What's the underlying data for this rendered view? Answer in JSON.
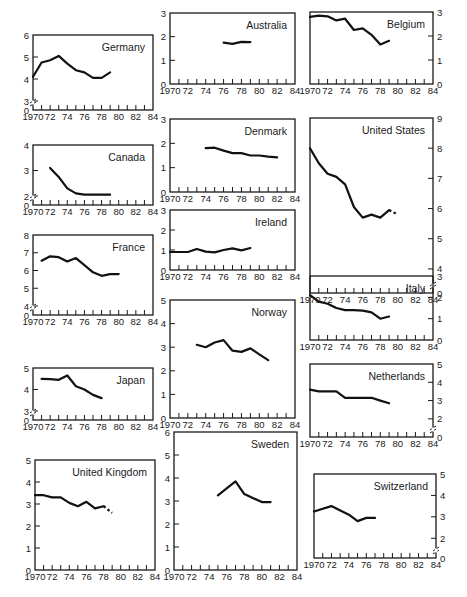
{
  "figure": {
    "x_ticks": [
      "1970",
      "72",
      "74",
      "76",
      "78",
      "80",
      "82",
      "84"
    ]
  },
  "chart_data": [
    {
      "type": "line",
      "title": "Germany",
      "axis_side": "left",
      "y_ticks": [
        0,
        3,
        4,
        5,
        6
      ],
      "axis_break": true,
      "ylim": [
        3,
        6
      ],
      "xlim": [
        1970,
        1984
      ],
      "x": [
        1970,
        1971,
        1972,
        1973,
        1974,
        1975,
        1976,
        1977,
        1978,
        1979
      ],
      "values": [
        4.1,
        4.75,
        4.85,
        5.05,
        4.7,
        4.4,
        4.3,
        4.05,
        4.05,
        4.3
      ]
    },
    {
      "type": "line",
      "title": "Australia",
      "axis_side": "left",
      "y_ticks": [
        0,
        1,
        2,
        3
      ],
      "axis_break": false,
      "ylim": [
        0,
        3
      ],
      "xlim": [
        1970,
        1984
      ],
      "x": [
        1976,
        1977,
        1978,
        1979
      ],
      "values": [
        1.75,
        1.7,
        1.78,
        1.77
      ]
    },
    {
      "type": "line",
      "title": "Belgium",
      "axis_side": "right",
      "y_ticks": [
        0,
        1,
        2,
        3
      ],
      "axis_break": false,
      "ylim": [
        0,
        3
      ],
      "xlim": [
        1970,
        1984
      ],
      "x": [
        1970,
        1971,
        1972,
        1973,
        1974,
        1975,
        1976,
        1977,
        1978,
        1979
      ],
      "values": [
        2.8,
        2.85,
        2.82,
        2.65,
        2.72,
        2.25,
        2.32,
        2.05,
        1.65,
        1.8
      ]
    },
    {
      "type": "line",
      "title": "Canada",
      "axis_side": "left",
      "y_ticks": [
        0,
        2,
        3,
        4
      ],
      "axis_break": true,
      "ylim": [
        2,
        4
      ],
      "xlim": [
        1970,
        1984
      ],
      "x": [
        1972,
        1973,
        1974,
        1975,
        1976,
        1977,
        1978,
        1979
      ],
      "values": [
        3.1,
        2.75,
        2.3,
        2.1,
        2.05,
        2.05,
        2.05,
        2.05
      ]
    },
    {
      "type": "line",
      "title": "Denmark",
      "axis_side": "left",
      "y_ticks": [
        0,
        1,
        2,
        3
      ],
      "axis_break": false,
      "ylim": [
        0,
        3
      ],
      "xlim": [
        1970,
        1984
      ],
      "x": [
        1974,
        1975,
        1976,
        1977,
        1978,
        1979,
        1980,
        1981,
        1982
      ],
      "values": [
        1.8,
        1.82,
        1.7,
        1.6,
        1.6,
        1.5,
        1.5,
        1.45,
        1.42
      ]
    },
    {
      "type": "line",
      "title": "United States",
      "axis_side": "right",
      "y_ticks": [
        0,
        4,
        5,
        6,
        7,
        8,
        9
      ],
      "axis_break": true,
      "ylim": [
        3.5,
        9
      ],
      "xlim": [
        1970,
        1984
      ],
      "x": [
        1970,
        1971,
        1972,
        1973,
        1974,
        1975,
        1976,
        1977,
        1978,
        1979
      ],
      "values": [
        8.0,
        7.5,
        7.15,
        7.05,
        6.8,
        6.05,
        5.7,
        5.8,
        5.7,
        5.95
      ],
      "projected": {
        "x": [
          1979,
          1980
        ],
        "values": [
          5.95,
          5.8
        ]
      }
    },
    {
      "type": "line",
      "title": "France",
      "axis_side": "left",
      "y_ticks": [
        0,
        4,
        5,
        6,
        7,
        8
      ],
      "axis_break": true,
      "ylim": [
        4,
        8
      ],
      "xlim": [
        1970,
        1984
      ],
      "x": [
        1971,
        1972,
        1973,
        1974,
        1975,
        1976,
        1977,
        1978,
        1979,
        1980
      ],
      "values": [
        6.55,
        6.8,
        6.75,
        6.5,
        6.7,
        6.3,
        5.9,
        5.7,
        5.8,
        5.8
      ]
    },
    {
      "type": "line",
      "title": "Ireland",
      "axis_side": "left",
      "y_ticks": [
        0,
        1,
        2,
        3
      ],
      "axis_break": false,
      "ylim": [
        0,
        3
      ],
      "xlim": [
        1970,
        1984
      ],
      "x": [
        1970,
        1971,
        1972,
        1973,
        1974,
        1975,
        1976,
        1977,
        1978,
        1979
      ],
      "values": [
        0.9,
        0.9,
        0.9,
        1.05,
        0.92,
        0.88,
        1.0,
        1.08,
        0.98,
        1.1
      ]
    },
    {
      "type": "line",
      "title": "Italy",
      "axis_side": "right",
      "y_ticks": [
        0,
        1,
        2,
        3
      ],
      "axis_break": false,
      "ylim": [
        0,
        3
      ],
      "xlim": [
        1970,
        1984
      ],
      "x": [
        1970,
        1971,
        1972,
        1973,
        1974,
        1975,
        1976,
        1977,
        1978,
        1979
      ],
      "values": [
        2.1,
        1.8,
        1.7,
        1.5,
        1.4,
        1.4,
        1.38,
        1.3,
        1.0,
        1.1
      ]
    },
    {
      "type": "line",
      "title": "Japan",
      "axis_side": "left",
      "y_ticks": [
        0,
        3,
        4,
        5
      ],
      "axis_break": true,
      "ylim": [
        3,
        5
      ],
      "xlim": [
        1970,
        1984
      ],
      "x": [
        1971,
        1972,
        1973,
        1974,
        1975,
        1976,
        1977,
        1978
      ],
      "values": [
        4.5,
        4.48,
        4.45,
        4.65,
        4.15,
        4.0,
        3.75,
        3.6
      ]
    },
    {
      "type": "line",
      "title": "Norway",
      "axis_side": "left",
      "y_ticks": [
        0,
        1,
        2,
        3,
        4,
        5
      ],
      "axis_break": false,
      "ylim": [
        0,
        5
      ],
      "xlim": [
        1970,
        1984
      ],
      "x": [
        1973,
        1974,
        1975,
        1976,
        1977,
        1978,
        1979,
        1980,
        1981
      ],
      "values": [
        3.1,
        3.0,
        3.2,
        3.3,
        2.85,
        2.8,
        2.95,
        2.7,
        2.45
      ]
    },
    {
      "type": "line",
      "title": "Netherlands",
      "axis_side": "right",
      "y_ticks": [
        0,
        2,
        3,
        4,
        5
      ],
      "axis_break": true,
      "ylim": [
        1.5,
        5
      ],
      "xlim": [
        1970,
        1984
      ],
      "x": [
        1970,
        1971,
        1972,
        1973,
        1974,
        1975,
        1976,
        1977,
        1978,
        1979
      ],
      "values": [
        3.6,
        3.5,
        3.5,
        3.5,
        3.15,
        3.15,
        3.15,
        3.15,
        3.0,
        2.85
      ]
    },
    {
      "type": "line",
      "title": "United Kingdom",
      "axis_side": "left",
      "y_ticks": [
        0,
        1,
        2,
        3,
        4,
        5
      ],
      "axis_break": false,
      "ylim": [
        0,
        5
      ],
      "xlim": [
        1970,
        1984
      ],
      "x": [
        1970,
        1971,
        1972,
        1973,
        1974,
        1975,
        1976,
        1977,
        1978
      ],
      "values": [
        3.4,
        3.4,
        3.3,
        3.3,
        3.05,
        2.9,
        3.1,
        2.8,
        2.9
      ],
      "projected": {
        "x": [
          1978,
          1979
        ],
        "values": [
          2.9,
          2.6
        ]
      }
    },
    {
      "type": "line",
      "title": "Sweden",
      "axis_side": "left",
      "y_ticks": [
        0,
        1,
        2,
        3,
        4,
        5,
        6
      ],
      "axis_break": false,
      "ylim": [
        0,
        6
      ],
      "xlim": [
        1970,
        1984
      ],
      "x": [
        1975,
        1977,
        1978,
        1980,
        1981
      ],
      "values": [
        3.25,
        3.85,
        3.3,
        2.95,
        2.95
      ]
    },
    {
      "type": "line",
      "title": "Switzerland",
      "axis_side": "right",
      "y_ticks": [
        0,
        2,
        3,
        4,
        5
      ],
      "axis_break": true,
      "ylim": [
        1.5,
        5
      ],
      "xlim": [
        1970,
        1984
      ],
      "x": [
        1970,
        1972,
        1974,
        1975,
        1976,
        1977
      ],
      "values": [
        3.25,
        3.5,
        3.1,
        2.8,
        2.95,
        2.95
      ]
    }
  ],
  "panels": [
    {
      "title": "Germany",
      "x": 33,
      "y": 35,
      "w": 120,
      "h": 75,
      "ylim": [
        3,
        6
      ],
      "ticks": [
        [
          6,
          "6"
        ],
        [
          5,
          "5"
        ],
        [
          4,
          "4"
        ],
        [
          3,
          "3"
        ]
      ],
      "zero": true,
      "side": "left"
    },
    {
      "title": "Australia",
      "x": 170,
      "y": 13,
      "w": 125,
      "h": 71,
      "ylim": [
        0,
        3
      ],
      "ticks": [
        [
          3,
          "3"
        ],
        [
          2,
          "2"
        ],
        [
          1,
          "1"
        ],
        [
          0,
          "0"
        ]
      ],
      "zero": false,
      "side": "left"
    },
    {
      "title": "Belgium",
      "x": 310,
      "y": 12,
      "w": 123,
      "h": 72,
      "ylim": [
        0,
        3
      ],
      "ticks": [
        [
          3,
          "3"
        ],
        [
          2,
          "2"
        ],
        [
          1,
          "1"
        ],
        [
          0,
          "0"
        ]
      ],
      "zero": false,
      "side": "right"
    },
    {
      "title": "Canada",
      "x": 33,
      "y": 145,
      "w": 120,
      "h": 60,
      "ylim": [
        2,
        4
      ],
      "ticks": [
        [
          4,
          "4"
        ],
        [
          3,
          "3"
        ],
        [
          2,
          "2"
        ]
      ],
      "zero": true,
      "side": "left"
    },
    {
      "title": "Denmark",
      "x": 170,
      "y": 119,
      "w": 125,
      "h": 73,
      "ylim": [
        0,
        3
      ],
      "ticks": [
        [
          3,
          "3"
        ],
        [
          2,
          "2"
        ],
        [
          1,
          "1"
        ],
        [
          0,
          "0"
        ]
      ],
      "zero": false,
      "side": "left"
    },
    {
      "title": "United States",
      "x": 310,
      "y": 118,
      "w": 123,
      "h": 175,
      "ylim": [
        3.5,
        9
      ],
      "ticks": [
        [
          9,
          "9"
        ],
        [
          8,
          "8"
        ],
        [
          7,
          "7"
        ],
        [
          6,
          "6"
        ],
        [
          5,
          "5"
        ],
        [
          4,
          "4"
        ]
      ],
      "zero": true,
      "side": "right"
    },
    {
      "title": "France",
      "x": 33,
      "y": 235,
      "w": 120,
      "h": 80,
      "ylim": [
        4,
        8
      ],
      "ticks": [
        [
          8,
          "8"
        ],
        [
          7,
          "7"
        ],
        [
          6,
          "6"
        ],
        [
          5,
          "5"
        ],
        [
          4,
          "4"
        ]
      ],
      "zero": true,
      "side": "left"
    },
    {
      "title": "Ireland",
      "x": 170,
      "y": 210,
      "w": 125,
      "h": 60,
      "ylim": [
        0,
        3
      ],
      "ticks": [
        [
          3,
          "3"
        ],
        [
          2,
          "2"
        ],
        [
          1,
          "1"
        ],
        [
          0,
          "0"
        ]
      ],
      "zero": false,
      "side": "left"
    },
    {
      "title": "Italy",
      "x": 310,
      "y": 276,
      "w": 123,
      "h": 64,
      "ylim": [
        0,
        3
      ],
      "ticks": [
        [
          3,
          "3"
        ],
        [
          2,
          "2"
        ],
        [
          1,
          "1"
        ],
        [
          0,
          "0"
        ]
      ],
      "zero": false,
      "side": "right"
    },
    {
      "title": "Japan",
      "x": 33,
      "y": 368,
      "w": 120,
      "h": 52,
      "ylim": [
        3,
        5
      ],
      "ticks": [
        [
          5,
          "5"
        ],
        [
          4,
          "4"
        ],
        [
          3,
          "3"
        ]
      ],
      "zero": true,
      "side": "left"
    },
    {
      "title": "Norway",
      "x": 170,
      "y": 300,
      "w": 125,
      "h": 118,
      "ylim": [
        0,
        5
      ],
      "ticks": [
        [
          5,
          "5"
        ],
        [
          4,
          "4"
        ],
        [
          3,
          "3"
        ],
        [
          2,
          "2"
        ],
        [
          1,
          "1"
        ],
        [
          0,
          "0"
        ]
      ],
      "zero": false,
      "side": "left"
    },
    {
      "title": "Netherlands",
      "x": 310,
      "y": 364,
      "w": 123,
      "h": 73,
      "ylim": [
        1.5,
        5
      ],
      "ticks": [
        [
          5,
          "5"
        ],
        [
          4,
          "4"
        ],
        [
          3,
          "3"
        ],
        [
          2,
          "2"
        ]
      ],
      "zero": true,
      "side": "right"
    },
    {
      "title": "United Kingdom",
      "x": 35,
      "y": 460,
      "w": 120,
      "h": 110,
      "ylim": [
        0,
        5
      ],
      "ticks": [
        [
          5,
          "5"
        ],
        [
          4,
          "4"
        ],
        [
          3,
          "3"
        ],
        [
          2,
          "2"
        ],
        [
          1,
          "1"
        ],
        [
          0,
          "0"
        ]
      ],
      "zero": false,
      "side": "left"
    },
    {
      "title": "Sweden",
      "x": 174,
      "y": 432,
      "w": 123,
      "h": 138,
      "ylim": [
        0,
        6
      ],
      "ticks": [
        [
          6,
          "6"
        ],
        [
          5,
          "5"
        ],
        [
          4,
          "4"
        ],
        [
          3,
          "3"
        ],
        [
          2,
          "2"
        ],
        [
          1,
          "1"
        ],
        [
          0,
          "0"
        ]
      ],
      "zero": false,
      "side": "left"
    },
    {
      "title": "Switzerland",
      "x": 314,
      "y": 474,
      "w": 122,
      "h": 84,
      "ylim": [
        1.5,
        5
      ],
      "ticks": [
        [
          5,
          "5"
        ],
        [
          4,
          "4"
        ],
        [
          3,
          "3"
        ],
        [
          2,
          "2"
        ]
      ],
      "zero": true,
      "side": "right"
    }
  ]
}
